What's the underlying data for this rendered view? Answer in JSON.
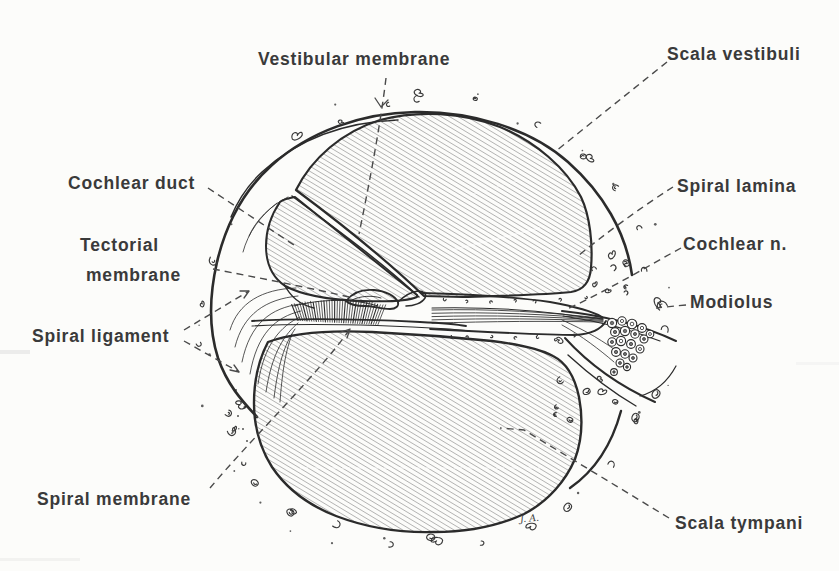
{
  "figure": {
    "colors": {
      "paper": "#fcfcfa",
      "ink": "#2b2b2b",
      "hatch": "#7b7b7b",
      "label_text": "#3a3a3a",
      "leader_line": "#4a4a4a"
    },
    "artist_initials": "J. A.",
    "labels": [
      {
        "id": "vestibular-membrane",
        "text": "Vestibular membrane"
      },
      {
        "id": "scala-vestibuli",
        "text": "Scala vestibuli"
      },
      {
        "id": "cochlear-duct",
        "text": "Cochlear duct"
      },
      {
        "id": "tectorial-membrane",
        "text": "Tectorial membrane",
        "line1": "Tectorial",
        "line2": "membrane"
      },
      {
        "id": "spiral-ligament",
        "text": "Spiral ligament"
      },
      {
        "id": "spiral-membrane",
        "text": "Spiral membrane"
      },
      {
        "id": "spiral-lamina",
        "text": "Spiral lamina"
      },
      {
        "id": "cochlear-n",
        "text": "Cochlear n."
      },
      {
        "id": "modiolus",
        "text": "Modiolus"
      },
      {
        "id": "scala-tympani",
        "text": "Scala tympani"
      }
    ]
  }
}
